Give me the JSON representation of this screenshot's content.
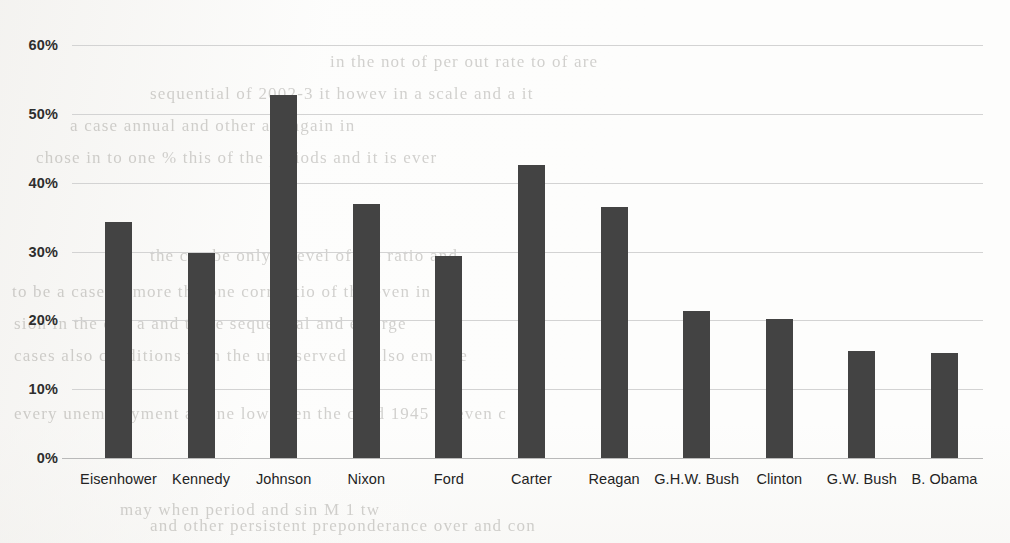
{
  "chart_data": {
    "type": "bar",
    "title": "",
    "subtitle": "",
    "xlabel": "",
    "ylabel": "",
    "categories": [
      "Eisenhower",
      "Kennedy",
      "Johnson",
      "Nixon",
      "Ford",
      "Carter",
      "Reagan",
      "G.H.W. Bush",
      "Clinton",
      "G.W. Bush",
      "B. Obama"
    ],
    "values": [
      34.3,
      29.8,
      52.7,
      36.9,
      29.4,
      42.6,
      36.4,
      21.4,
      20.2,
      15.6,
      15.2
    ],
    "value_format": "percent",
    "ylim": [
      0,
      60
    ],
    "ytick_values": [
      0,
      10,
      20,
      30,
      40,
      50,
      60
    ],
    "ytick_labels": [
      "0%",
      "10%",
      "20%",
      "30%",
      "40%",
      "50%",
      "60%"
    ],
    "grid": true,
    "grid_axis": "y",
    "legend": false,
    "legend_position": "none",
    "bar_color": "#434343",
    "gridline_color": "#d3d3d3",
    "axis_color": "#b9b9b9",
    "background_color": "#fdfdfc",
    "data_labels": false
  },
  "page_artifacts": {
    "description": "faint bleed-through text from reverse side of scanned page",
    "lines": [
      "in the not of  per    out  rate  to  of  are",
      "sequential  of  2002-3  it  howev  in  a  scale  and  a  it",
      "a  case            annual  and  other    are    again  in",
      "chose  in  to  one  %  this of the  periods  and  it  is  ever",
      "the  can  be  only  a  level  of  the  ratio  and",
      "to  be  a  case  of  more  the  one  corr  ratio  of  the  even  in  my",
      "sion  in  the  one  a  and  to  be  sequential  and  emerge",
      "cases  also  conditions  than  the  unobserved  in  also  emerge",
      "every  unemployment  as  one  low  been  the  cond  1945  to  even  c",
      "may  when  period  and  sin    M            1            tw",
      "and  other  persistent    preponderance  over  and  con"
    ]
  }
}
